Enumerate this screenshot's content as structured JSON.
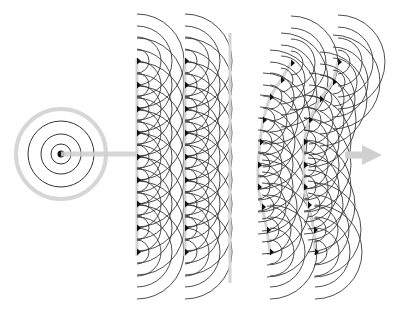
{
  "diagram": {
    "title": "Huygens principle: wavefront propagation from secondary sources",
    "width": 395,
    "height": 312,
    "colors": {
      "background": "#ffffff",
      "arc": "#3a3a3a",
      "dot": "#111111",
      "guide": "#d4d4d4",
      "arrow": "#d0d0d0",
      "source_ring": "#d6d6d6",
      "source_circle": "#333333"
    },
    "point_source": {
      "cx": 61,
      "cy": 154,
      "radii": [
        10,
        20,
        33
      ],
      "outer_ring_radius": 45,
      "outer_ring_width": 4,
      "dot_radius": 3.5
    },
    "incoming_ray": {
      "x1": 61,
      "x2": 136,
      "y": 154,
      "width": 5
    },
    "arc_radii": [
      12,
      24,
      35,
      47
    ],
    "plane_wavefronts": [
      {
        "name": "plane-wavefront-1",
        "guide_x": 137,
        "guide_y1": 58,
        "guide_y2": 256,
        "sources": [
          [
            137,
            61
          ],
          [
            137,
            85
          ],
          [
            137,
            109
          ],
          [
            137,
            133
          ],
          [
            137,
            157
          ],
          [
            137,
            180
          ],
          [
            137,
            204
          ],
          [
            137,
            228
          ],
          [
            137,
            252
          ]
        ]
      },
      {
        "name": "plane-wavefront-2",
        "guide_x": 185,
        "guide_y1": 58,
        "guide_y2": 256,
        "sources": [
          [
            185,
            61
          ],
          [
            185,
            85
          ],
          [
            185,
            109
          ],
          [
            185,
            133
          ],
          [
            185,
            157
          ],
          [
            185,
            180
          ],
          [
            185,
            204
          ],
          [
            185,
            228
          ],
          [
            185,
            252
          ]
        ]
      }
    ],
    "plane_envelope": {
      "x": 230,
      "y1": 33,
      "y2": 283,
      "width": 3
    },
    "curved_wavefronts": [
      {
        "name": "curved-wavefront-1",
        "sources": [
          [
            291,
            63
          ],
          [
            281,
            80
          ],
          [
            270,
            97
          ],
          [
            263,
            120
          ],
          [
            260,
            142
          ],
          [
            258,
            165
          ],
          [
            258,
            187
          ],
          [
            262,
            207
          ],
          [
            267,
            230
          ],
          [
            270,
            252
          ]
        ]
      },
      {
        "name": "curved-wavefront-2",
        "sources": [
          [
            338,
            62
          ],
          [
            333,
            82
          ],
          [
            320,
            99
          ],
          [
            309,
            120
          ],
          [
            304,
            142
          ],
          [
            304,
            165
          ],
          [
            304,
            187
          ],
          [
            308,
            205
          ],
          [
            314,
            230
          ],
          [
            315,
            252
          ]
        ]
      }
    ],
    "outgoing_arrow": {
      "x1": 345,
      "x2": 382,
      "y": 155,
      "shaft_width": 7,
      "head_length": 20,
      "head_width": 20
    }
  }
}
